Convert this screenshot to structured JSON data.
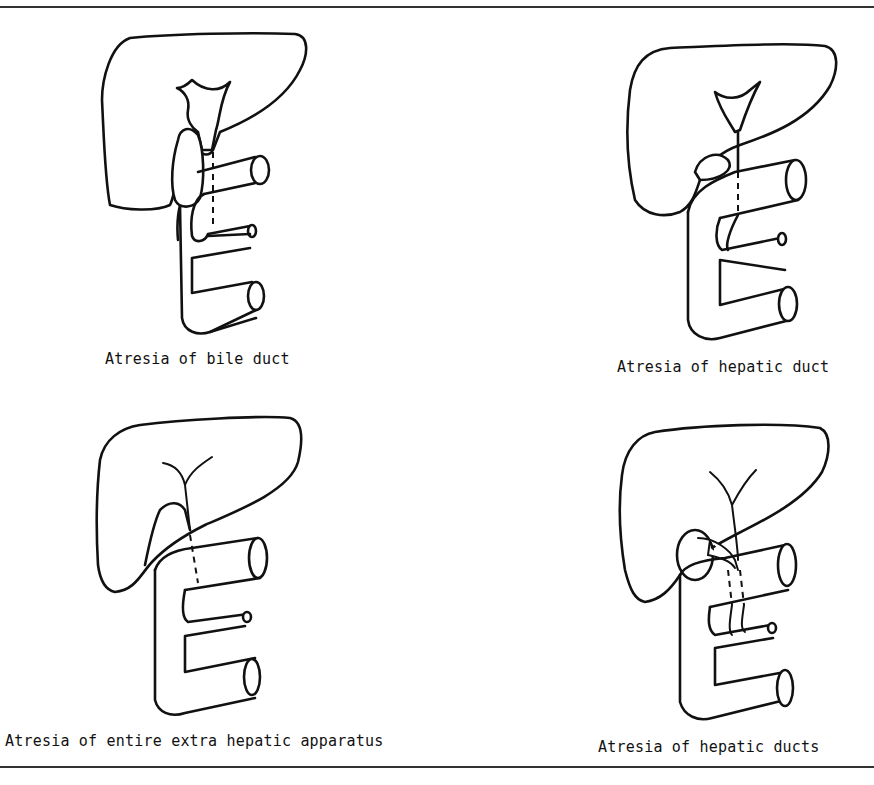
{
  "figure": {
    "panels": [
      {
        "id": "bile-duct",
        "caption": "Atresia of bile duct"
      },
      {
        "id": "hepatic-duct",
        "caption": "Atresia of hepatic duct"
      },
      {
        "id": "entire-extrahepatic",
        "caption": "Atresia of entire extra hepatic apparatus"
      },
      {
        "id": "hepatic-ducts",
        "caption": "Atresia of hepatic ducts"
      }
    ],
    "colors": {
      "ink": "#111111",
      "background": "#ffffff"
    }
  }
}
